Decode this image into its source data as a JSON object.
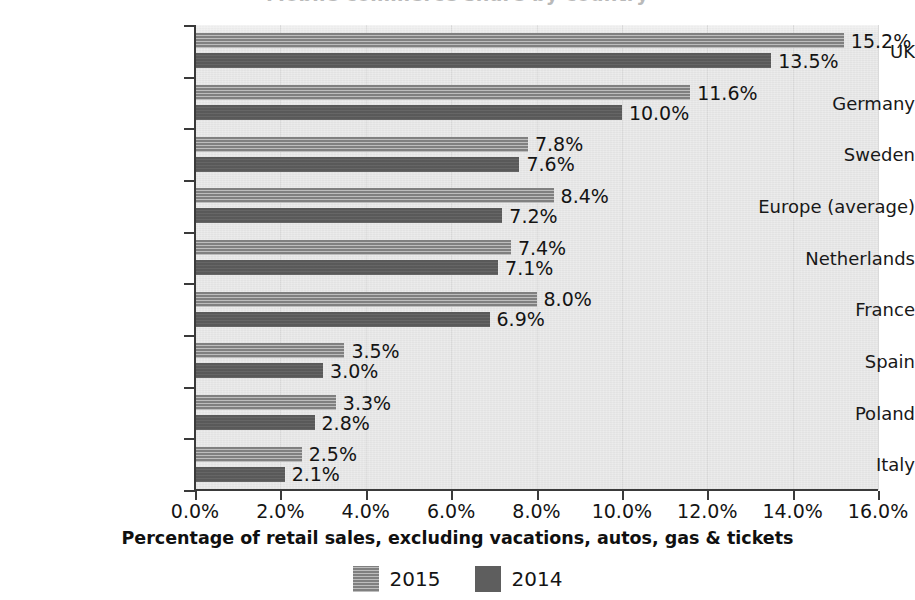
{
  "chart_data": {
    "type": "bar",
    "orientation": "horizontal",
    "title": "Mobile commerce share by country",
    "categories": [
      "UK",
      "Germany",
      "Sweden",
      "Europe (average)",
      "Netherlands",
      "France",
      "Spain",
      "Poland",
      "Italy"
    ],
    "series": [
      {
        "name": "2015",
        "values": [
          15.2,
          11.6,
          7.8,
          8.4,
          7.4,
          8.0,
          3.5,
          3.3,
          2.5
        ],
        "labels": [
          "15.2%",
          "11.6%",
          "7.8%",
          "8.4%",
          "7.4%",
          "8.0%",
          "3.5%",
          "3.3%",
          "2.5%"
        ],
        "color": "#8e8e8e",
        "fill": "hatched"
      },
      {
        "name": "2014",
        "values": [
          13.5,
          10.0,
          7.6,
          7.2,
          7.1,
          6.9,
          3.0,
          2.8,
          2.1
        ],
        "labels": [
          "13.5%",
          "10.0%",
          "7.6%",
          "7.2%",
          "7.1%",
          "6.9%",
          "3.0%",
          "2.8%",
          "2.1%"
        ],
        "color": "#5e5e5e",
        "fill": "solid"
      }
    ],
    "xlabel": "Percentage of retail sales, excluding vacations, autos, gas & tickets",
    "ylabel": "",
    "xlim": [
      0,
      16
    ],
    "xticks": [
      0,
      2,
      4,
      6,
      8,
      10,
      12,
      14,
      16
    ],
    "xticklabels": [
      "0.0%",
      "2.0%",
      "4.0%",
      "6.0%",
      "8.0%",
      "10.0%",
      "12.0%",
      "14.0%",
      "16.0%"
    ],
    "grid": "vertical",
    "legend_position": "bottom",
    "plot_background": "#e6e6e6",
    "axis_color": "#3a3a3a"
  },
  "legend": {
    "items": [
      {
        "label": "2015",
        "series": "s2015"
      },
      {
        "label": "2014",
        "series": "s2014"
      }
    ]
  }
}
